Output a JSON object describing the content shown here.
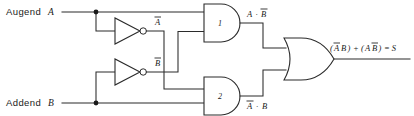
{
  "diagram": {
    "type": "logic-gate-diagram",
    "background_color": "#ffffff",
    "line_color": "#2b2b2b",
    "text_color": "#1a1a1a"
  },
  "inputs": [
    {
      "role_label": "Augend",
      "signal": "A"
    },
    {
      "role_label": "Addend",
      "signal": "B"
    }
  ],
  "inverters": [
    {
      "id": "inv-a",
      "input": "A",
      "output_label": "A",
      "output_overbar": true
    },
    {
      "id": "inv-b",
      "input": "B",
      "output_label": "B",
      "output_overbar": true
    }
  ],
  "and_gates": [
    {
      "id": "and-1",
      "number": "1",
      "inputs": [
        "A",
        "B̅"
      ],
      "output_label": "A · B",
      "output_plain": "A · B̅"
    },
    {
      "id": "and-2",
      "number": "2",
      "inputs": [
        "A̅",
        "B"
      ],
      "output_label": "A · B",
      "output_plain": "A̅ · B"
    }
  ],
  "or_gate": {
    "id": "or-1",
    "inputs": [
      "A · B̅",
      "A̅ · B"
    ],
    "output_expression": "(A̅B) + (AB̅) = S",
    "output_signal": "S"
  },
  "labels": {
    "inv_a_out": "A",
    "inv_b_out": "B",
    "and1_out_left": "A",
    "and1_out_right": "B",
    "and1_dot": "·",
    "and2_out_left": "A",
    "and2_out_right": "B",
    "and2_dot": "·",
    "gate1_num": "1",
    "gate2_num": "2",
    "out_open1": "(",
    "out_a1": "A",
    "out_b1": "B",
    "out_close1": ")",
    "out_plus": "+",
    "out_open2": "(",
    "out_a2": "A",
    "out_b2": "B",
    "out_close2": ")",
    "out_eq": "= S"
  }
}
